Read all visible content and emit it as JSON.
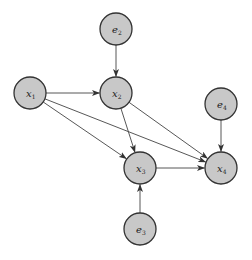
{
  "diagram": {
    "type": "directed-acyclic-graph",
    "colors": {
      "node_fill": "#c8c8c8",
      "node_stroke": "#333333",
      "edge": "#444444",
      "background": "#ffffff"
    },
    "nodes": [
      {
        "id": "e2",
        "base": "e",
        "sub": "2",
        "cx": 116,
        "cy": 29,
        "r": 16
      },
      {
        "id": "x1",
        "base": "x",
        "sub": "1",
        "cx": 30,
        "cy": 93,
        "r": 16
      },
      {
        "id": "x2",
        "base": "x",
        "sub": "2",
        "cx": 116,
        "cy": 93,
        "r": 16
      },
      {
        "id": "e4",
        "base": "e",
        "sub": "4",
        "cx": 221,
        "cy": 104,
        "r": 16
      },
      {
        "id": "x3",
        "base": "x",
        "sub": "3",
        "cx": 140,
        "cy": 168,
        "r": 16
      },
      {
        "id": "x4",
        "base": "x",
        "sub": "4",
        "cx": 221,
        "cy": 168,
        "r": 16
      },
      {
        "id": "e3",
        "base": "e",
        "sub": "3",
        "cx": 140,
        "cy": 229,
        "r": 16
      }
    ],
    "edges": [
      {
        "from": "e2",
        "to": "x2"
      },
      {
        "from": "x1",
        "to": "x2"
      },
      {
        "from": "x1",
        "to": "x3"
      },
      {
        "from": "x1",
        "to": "x4"
      },
      {
        "from": "x2",
        "to": "x3"
      },
      {
        "from": "x2",
        "to": "x4"
      },
      {
        "from": "e4",
        "to": "x4"
      },
      {
        "from": "x3",
        "to": "x4"
      },
      {
        "from": "e3",
        "to": "x3"
      }
    ]
  }
}
